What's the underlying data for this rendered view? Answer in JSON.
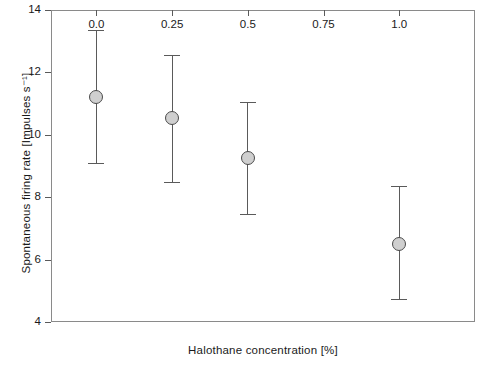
{
  "chart_data": {
    "type": "scatter",
    "title": "",
    "xlabel": "Halothane concentration [%]",
    "ylabel": "Spontaneous firing rate [Impulses s⁻¹]",
    "xlim": [
      -0.15,
      1.25
    ],
    "ylim": [
      4,
      14
    ],
    "grid": false,
    "legend": null,
    "xticks": [
      0.0,
      0.25,
      0.5,
      0.75,
      1.0
    ],
    "xtick_labels": [
      "0.0",
      "0.25",
      "0.5",
      "0.75",
      "1.0"
    ],
    "yticks": [
      4,
      6,
      8,
      10,
      12,
      14
    ],
    "ytick_labels": [
      "4",
      "6",
      "8",
      "10",
      "12",
      "14"
    ],
    "error_type": "error-bars",
    "x": [
      0.0,
      0.25,
      0.5,
      1.0
    ],
    "values": [
      11.2,
      10.55,
      9.25,
      6.5
    ],
    "err_low": [
      9.1,
      8.5,
      7.45,
      4.75
    ],
    "err_high": [
      13.35,
      12.55,
      11.05,
      8.35
    ],
    "points": [
      {
        "x": 0.0,
        "y": 11.2,
        "low": 9.1,
        "high": 13.35
      },
      {
        "x": 0.25,
        "y": 10.55,
        "low": 8.5,
        "high": 12.55
      },
      {
        "x": 0.5,
        "y": 9.25,
        "low": 7.45,
        "high": 11.05
      },
      {
        "x": 1.0,
        "y": 6.5,
        "low": 4.75,
        "high": 8.35
      }
    ],
    "marker_fill": "#cfcfcf",
    "marker_edge": "#4a4a4a",
    "line_color": "#5a5a5a",
    "frame_color": "#8a8a8a",
    "background": "#ffffff"
  }
}
